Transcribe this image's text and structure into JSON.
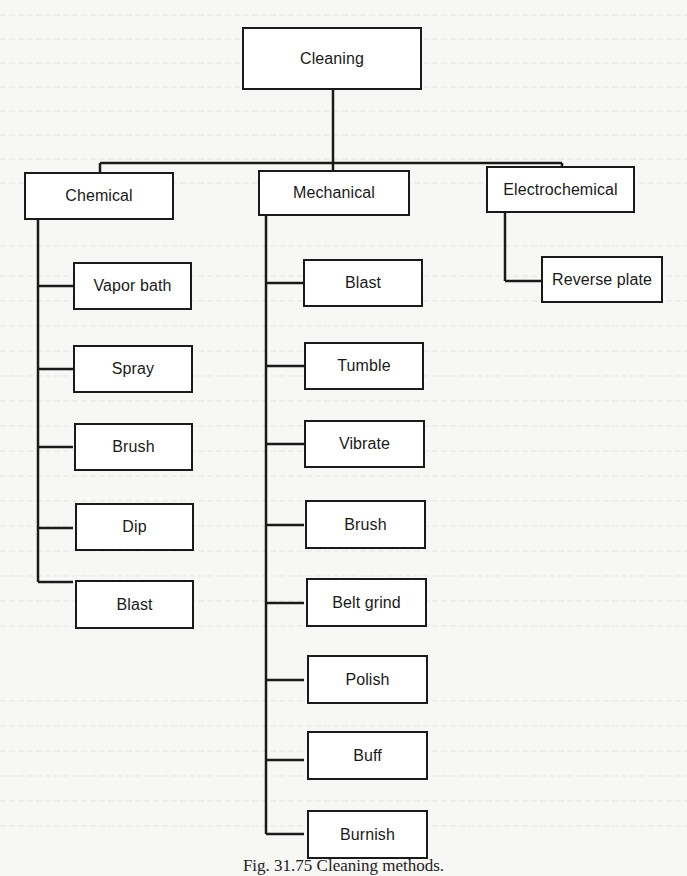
{
  "diagram": {
    "type": "tree",
    "root": {
      "label": "Cleaning"
    },
    "categories": [
      {
        "label": "Chemical",
        "children": [
          "Vapor bath",
          "Spray",
          "Brush",
          "Dip",
          "Blast"
        ]
      },
      {
        "label": "Mechanical",
        "children": [
          "Blast",
          "Tumble",
          "Vibrate",
          "Brush",
          "Belt grind",
          "Polish",
          "Buff",
          "Burnish"
        ]
      },
      {
        "label": "Electrochemical",
        "children": [
          "Reverse plate"
        ]
      }
    ],
    "caption": "Fig. 31.75   Cleaning methods."
  },
  "colors": {
    "line": "#1a1a1a",
    "box_fill": "#ffffff",
    "page": "#f7f7f5"
  }
}
